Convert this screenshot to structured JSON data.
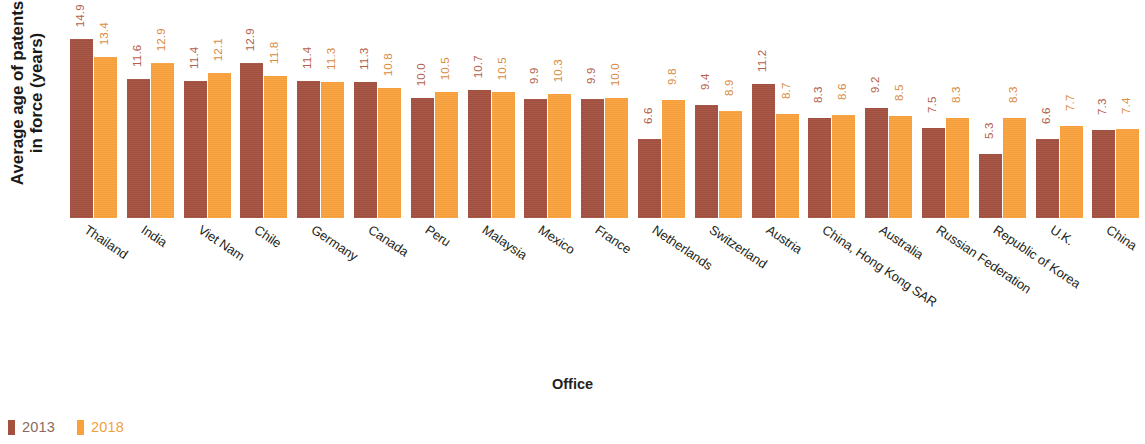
{
  "chart_data": {
    "type": "bar",
    "title": "",
    "xlabel": "Office",
    "ylabel": "Average age of patents in force (years)",
    "ylabel_line1": "Average age of patents",
    "ylabel_line2": "in force (years)",
    "ylim": [
      0,
      15
    ],
    "grid": false,
    "legend_position": "bottom-left",
    "categories": [
      "Thailand",
      "India",
      "Viet Nam",
      "Chile",
      "Germany",
      "Canada",
      "Peru",
      "Malaysia",
      "Mexico",
      "France",
      "Netherlands",
      "Switzerland",
      "Austria",
      "China, Hong Kong SAR",
      "Australia",
      "Russian Federation",
      "Republic of Korea",
      "U.K.",
      "China"
    ],
    "series": [
      {
        "name": "2013",
        "color": "#a4503f",
        "values": [
          14.9,
          11.6,
          11.4,
          12.9,
          11.4,
          11.3,
          10.0,
          10.7,
          9.9,
          9.9,
          6.6,
          9.4,
          11.2,
          8.3,
          9.2,
          7.5,
          5.3,
          6.6,
          7.3
        ],
        "labels": [
          "14.9",
          "11.6",
          "11.4",
          "12.9",
          "11.4",
          "11.3",
          "10.0",
          "10.7",
          "9.9",
          "9.9",
          "6.6",
          "9.4",
          "11.2",
          "8.3",
          "9.2",
          "7.5",
          "5.3",
          "6.6",
          "7.3"
        ]
      },
      {
        "name": "2018",
        "color": "#f9a23c",
        "values": [
          13.4,
          12.9,
          12.1,
          11.8,
          11.3,
          10.8,
          10.5,
          10.5,
          10.3,
          10.0,
          9.8,
          8.9,
          8.7,
          8.6,
          8.5,
          8.3,
          8.3,
          7.7,
          7.4
        ],
        "labels": [
          "13.4",
          "12.9",
          "12.1",
          "11.8",
          "11.3",
          "10.8",
          "10.5",
          "10.5",
          "10.3",
          "10.0",
          "9.8",
          "8.9",
          "8.7",
          "8.6",
          "8.5",
          "8.3",
          "8.3",
          "7.7",
          "7.4"
        ]
      }
    ]
  },
  "legend": {
    "items": [
      {
        "label": "2013",
        "color": "#a4503f"
      },
      {
        "label": "2018",
        "color": "#f9a23c"
      }
    ]
  }
}
